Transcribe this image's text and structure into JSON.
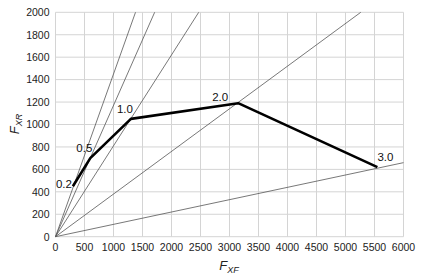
{
  "chart_data": {
    "type": "line",
    "title": "",
    "xlabel": "F_XF",
    "ylabel": "F_XR",
    "xlabel_main": "F",
    "xlabel_sub": "XF",
    "ylabel_main": "F",
    "ylabel_sub": "XR",
    "xlim": [
      0,
      6000
    ],
    "ylim": [
      0,
      2000
    ],
    "xticks": [
      0,
      500,
      1000,
      1500,
      2000,
      2500,
      3000,
      3500,
      4000,
      4500,
      5000,
      5500,
      6000
    ],
    "yticks": [
      0,
      200,
      400,
      600,
      800,
      1000,
      1200,
      1400,
      1600,
      1800,
      2000
    ],
    "grid": true,
    "legend": null,
    "series": [
      {
        "name": "ideal braking force distribution",
        "style": "thick-black",
        "points": [
          {
            "label": "0.2",
            "x": 300,
            "y": 450
          },
          {
            "label": "0.5",
            "x": 600,
            "y": 700
          },
          {
            "label": "1.0",
            "x": 1300,
            "y": 1050
          },
          {
            "label": "2.0",
            "x": 3150,
            "y": 1190
          },
          {
            "label": "3.0",
            "x": 5550,
            "y": 620
          }
        ]
      }
    ],
    "reference_lines": [
      {
        "name": "ray-0.2",
        "from": [
          0,
          0
        ],
        "slope": 1.45
      },
      {
        "name": "ray-0.5",
        "from": [
          0,
          0
        ],
        "slope": 1.17
      },
      {
        "name": "ray-1.0",
        "from": [
          0,
          0
        ],
        "slope": 0.81
      },
      {
        "name": "ray-2.0",
        "from": [
          0,
          0
        ],
        "slope": 0.38
      },
      {
        "name": "ray-3.0",
        "from": [
          0,
          0
        ],
        "slope": 0.11
      }
    ]
  }
}
